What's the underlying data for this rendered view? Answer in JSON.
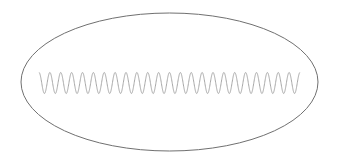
{
  "figure": {
    "width": 337,
    "height": 163,
    "background": "#ffffff",
    "ellipse": {
      "cx": 169.5,
      "cy": 82,
      "rx": 148.5,
      "ry": 69,
      "stroke": "#707070",
      "stroke_width": 1
    },
    "wave": {
      "x_start": 39,
      "x_end": 300,
      "y_center": 83,
      "amplitude": 10.5,
      "cycles": 24,
      "stroke": "#a8a8a8",
      "stroke_width": 1,
      "starts_at": "peak"
    }
  }
}
